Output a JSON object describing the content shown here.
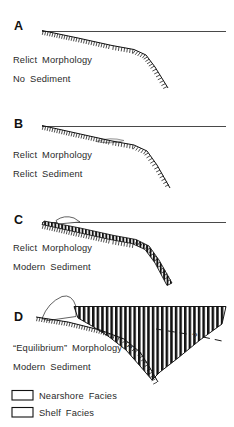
{
  "figure": {
    "background_color": "#ffffff",
    "ink_color": "#111111"
  },
  "panels": [
    {
      "letter": "A",
      "caption_line1": "Relict  Morphology",
      "caption_line2": "No  Sediment",
      "has_datum_line": true,
      "has_relict_surface": true,
      "has_relict_sediment_lens": false,
      "has_modern_sediment": false,
      "has_nearshore_facies": false,
      "has_shelf_facies": false,
      "has_query_dashed_line": false
    },
    {
      "letter": "B",
      "caption_line1": "Relict  Morphology",
      "caption_line2": "Relict  Sediment",
      "has_datum_line": true,
      "has_relict_surface": true,
      "has_relict_sediment_lens": true,
      "has_modern_sediment": false,
      "has_nearshore_facies": false,
      "has_shelf_facies": false,
      "has_query_dashed_line": false
    },
    {
      "letter": "C",
      "caption_line1": "Relict  Morphology",
      "caption_line2": "Modern  Sediment",
      "has_datum_line": true,
      "has_relict_surface": true,
      "has_relict_sediment_lens": false,
      "has_modern_sediment": true,
      "has_nearshore_facies": true,
      "has_shelf_facies": true,
      "has_query_dashed_line": false
    },
    {
      "letter": "D",
      "caption_line1": "“Equilibrium”  Morphology  ?",
      "caption_line2": "Modern  Sediment",
      "has_datum_line": true,
      "has_relict_surface": true,
      "has_relict_sediment_lens": false,
      "has_modern_sediment": true,
      "has_nearshore_facies": true,
      "has_shelf_facies": true,
      "has_query_dashed_line": true,
      "query_symbol": "?"
    }
  ],
  "legend": {
    "entries": [
      {
        "label": "Nearshore  Facies",
        "pattern": "stipple"
      },
      {
        "label": "Shelf  Facies",
        "pattern": "vertical-bars"
      }
    ]
  }
}
